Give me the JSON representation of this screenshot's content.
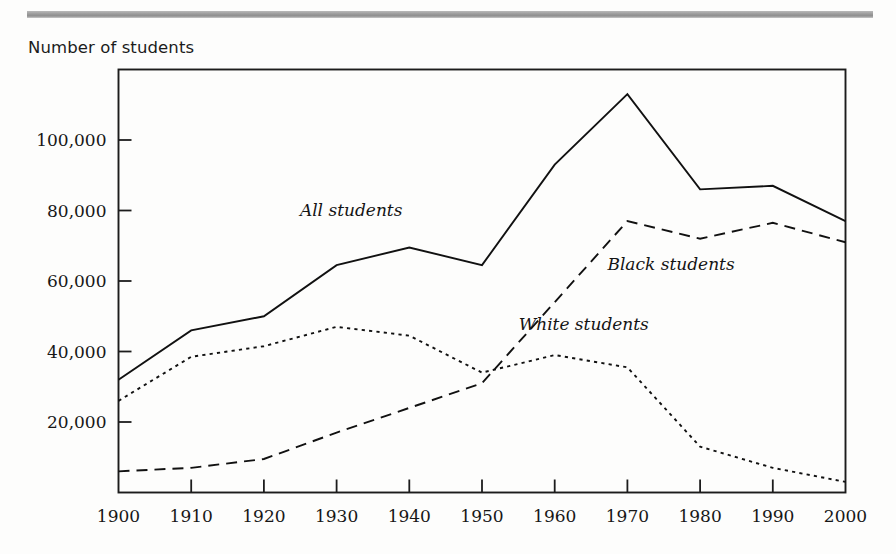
{
  "page": {
    "background_color": "#fdfdfc",
    "rule_color": "#9a9a9a"
  },
  "caption": {
    "y_axis_caption": "Number of students"
  },
  "chart_data": {
    "type": "line",
    "title": "",
    "subtitle": "",
    "xlabel": "",
    "ylabel": "Number of students",
    "x": [
      1900,
      1910,
      1920,
      1930,
      1940,
      1950,
      1960,
      1970,
      1980,
      1990,
      2000
    ],
    "categories": [
      "1900",
      "1910",
      "1920",
      "1930",
      "1940",
      "1950",
      "1960",
      "1970",
      "1980",
      "1990",
      "2000"
    ],
    "xlim": [
      1900,
      2000
    ],
    "ylim": [
      0,
      120000
    ],
    "y_ticks": [
      20000,
      40000,
      60000,
      80000,
      100000
    ],
    "y_tick_labels": [
      "20,000",
      "40,000",
      "60,000",
      "80,000",
      "100,000"
    ],
    "x_ticks": [
      1900,
      1910,
      1920,
      1930,
      1940,
      1950,
      1960,
      1970,
      1980,
      1990,
      2000
    ],
    "x_tick_labels": [
      "1900",
      "1910",
      "1920",
      "1930",
      "1940",
      "1950",
      "1960",
      "1970",
      "1980",
      "1990",
      "2000"
    ],
    "grid": false,
    "legend": "inline-annotations",
    "series": [
      {
        "name": "All students",
        "label": "All students",
        "style": "solid",
        "color": "#111111",
        "values": [
          32000,
          46000,
          50000,
          64500,
          69500,
          64500,
          93000,
          113000,
          86000,
          87000,
          77000
        ]
      },
      {
        "name": "Black students",
        "label": "Black students",
        "style": "dashed",
        "color": "#111111",
        "values": [
          6000,
          7000,
          9500,
          17000,
          24000,
          31000,
          54000,
          77000,
          72000,
          76500,
          71000
        ]
      },
      {
        "name": "White students",
        "label": "White students",
        "style": "dotted",
        "color": "#111111",
        "values": [
          26000,
          38500,
          41500,
          47000,
          44500,
          34000,
          39000,
          35500,
          13000,
          7000,
          3000
        ]
      }
    ],
    "annotations": [
      {
        "text": "All students",
        "x": 1932,
        "y": 78500,
        "style": "italic"
      },
      {
        "text": "Black students",
        "x": 1976,
        "y": 63000,
        "style": "italic"
      },
      {
        "text": "White students",
        "x": 1964,
        "y": 46000,
        "style": "italic"
      }
    ]
  }
}
